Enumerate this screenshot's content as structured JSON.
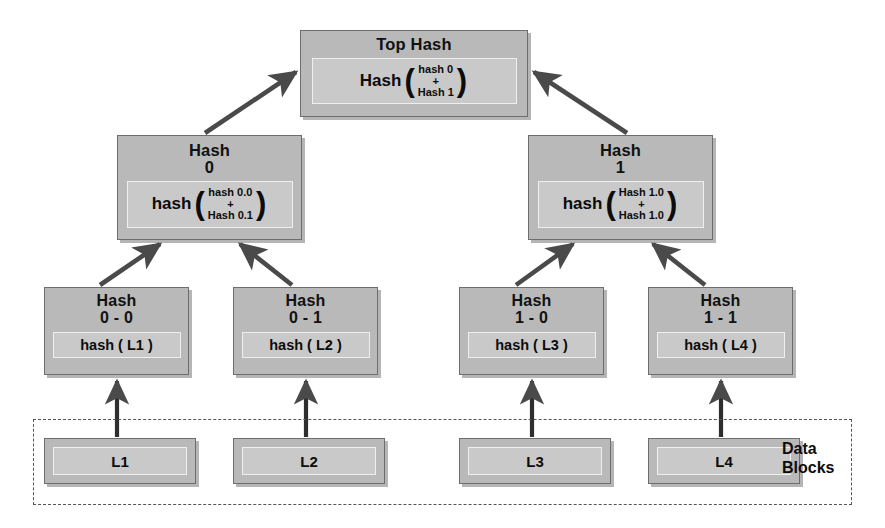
{
  "diagram": {
    "colors": {
      "node_fill": "#b9b9b9",
      "node_border": "#6d6d6d",
      "inner_fill": "#c9c9c9",
      "inner_border": "#efefef",
      "arrow": "#4a4a4a",
      "dashed_border": "#555555",
      "background": "#ffffff",
      "text": "#111111"
    },
    "levels": [
      {
        "name": "root",
        "nodes": [
          {
            "id": "top-hash",
            "title": "Top Hash",
            "expression": {
              "fn": "Hash",
              "open_paren": "(",
              "operand_a": "hash 0",
              "operator": "+",
              "operand_b": "Hash 1",
              "close_paren": ")"
            }
          }
        ]
      },
      {
        "name": "level-1",
        "nodes": [
          {
            "id": "hash-0",
            "title": "Hash\n0",
            "expression": {
              "fn": "hash",
              "open_paren": "(",
              "operand_a": "hash 0.0",
              "operator": "+",
              "operand_b": "Hash 0.1",
              "close_paren": ")"
            }
          },
          {
            "id": "hash-1",
            "title": "Hash\n1",
            "expression": {
              "fn": "hash",
              "open_paren": "(",
              "operand_a": "Hash 1.0",
              "operator": "+",
              "operand_b": "Hash 1.0",
              "close_paren": ")"
            }
          }
        ]
      },
      {
        "name": "level-2",
        "nodes": [
          {
            "id": "hash-0-0",
            "title": "Hash\n0 - 0",
            "expression_text": "hash ( L1 )"
          },
          {
            "id": "hash-0-1",
            "title": "Hash\n0 - 1",
            "expression_text": "hash ( L2 )"
          },
          {
            "id": "hash-1-0",
            "title": "Hash\n1 - 0",
            "expression_text": "hash ( L3 )"
          },
          {
            "id": "hash-1-1",
            "title": "Hash\n1 - 1",
            "expression_text": "hash ( L4 )"
          }
        ]
      }
    ],
    "data_blocks": {
      "group_label": "Data\nBlocks",
      "blocks": [
        {
          "id": "block-l1",
          "label": "L1"
        },
        {
          "id": "block-l2",
          "label": "L2"
        },
        {
          "id": "block-l3",
          "label": "L3"
        },
        {
          "id": "block-l4",
          "label": "L4"
        }
      ]
    },
    "edges": [
      {
        "from": "hash-0",
        "to": "top-hash",
        "style": "diagonal-arrow"
      },
      {
        "from": "hash-1",
        "to": "top-hash",
        "style": "diagonal-arrow"
      },
      {
        "from": "hash-0-0",
        "to": "hash-0",
        "style": "diagonal-arrow"
      },
      {
        "from": "hash-0-1",
        "to": "hash-0",
        "style": "diagonal-arrow"
      },
      {
        "from": "hash-1-0",
        "to": "hash-1",
        "style": "diagonal-arrow"
      },
      {
        "from": "hash-1-1",
        "to": "hash-1",
        "style": "diagonal-arrow"
      },
      {
        "from": "block-l1",
        "to": "hash-0-0",
        "style": "vertical-arrow"
      },
      {
        "from": "block-l2",
        "to": "hash-0-1",
        "style": "vertical-arrow"
      },
      {
        "from": "block-l3",
        "to": "hash-1-0",
        "style": "vertical-arrow"
      },
      {
        "from": "block-l4",
        "to": "hash-1-1",
        "style": "vertical-arrow"
      }
    ]
  }
}
